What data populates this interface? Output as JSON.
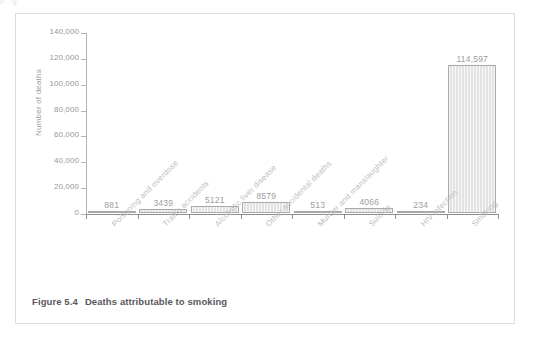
{
  "page": {
    "top_cut_text": "p                                                                                           ,                   g"
  },
  "figure": {
    "caption_number": "Figure 5.4",
    "caption_text": "Deaths attributable to smoking"
  },
  "chart_data": {
    "type": "bar",
    "title": "Deaths attributable to smoking",
    "xlabel": "",
    "ylabel": "Number of deaths",
    "ylim": [
      0,
      140000
    ],
    "ytick_labels": [
      "0",
      "20,000",
      "40,000",
      "60,000",
      "80,000",
      "100,000",
      "120,000",
      "140,000"
    ],
    "ytick_values": [
      0,
      20000,
      40000,
      60000,
      80000,
      100000,
      120000,
      140000
    ],
    "grid": false,
    "legend": false,
    "categories": [
      "Poisoning and overdose",
      "Traffic accidents",
      "Alcoholic liver disease",
      "Other accidental deaths",
      "Murder and manslaughter",
      "Suicide",
      "HIV infection",
      "Smoking"
    ],
    "values": [
      881,
      3439,
      5121,
      8579,
      513,
      4066,
      234,
      114597
    ],
    "value_labels": [
      "881",
      "3439",
      "5121",
      "8579",
      "513",
      "4066",
      "234",
      "114,597"
    ],
    "colors": {
      "bar_fill": "#e3e3e3",
      "bar_stroke": "#a9a9ac",
      "axis": "#8e8e91",
      "tick_label": "#98989b",
      "value_label": "#9d9d9f",
      "category_label": "#bcbcbf",
      "caption": "#58585b",
      "panel_border": "#dddee0",
      "background": "#ffffff"
    }
  }
}
